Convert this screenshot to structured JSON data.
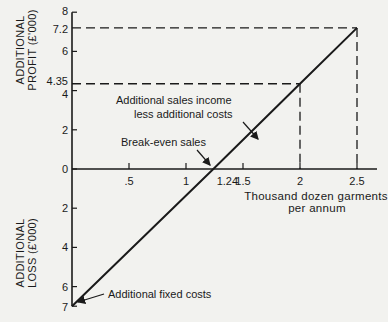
{
  "chart_data": {
    "type": "line",
    "title": "",
    "xlabel": "Thousand dozen garments per annum",
    "xlabel_lines": [
      "Thousand dozen garments",
      "per annum"
    ],
    "ylabel_profit_lines": [
      "ADDITIONAL",
      "PROFIT (£'000)"
    ],
    "ylabel_loss_lines": [
      "ADDITIONAL",
      "LOSS (£'000)"
    ],
    "xlim": [
      0,
      2.6
    ],
    "ylim": [
      -7,
      8
    ],
    "x_ticks": [
      {
        "value": 0.5,
        "label": ".5"
      },
      {
        "value": 1,
        "label": "1"
      },
      {
        "value": 1.24,
        "label": "1.24"
      },
      {
        "value": 1.5,
        "label": "1.5"
      },
      {
        "value": 2,
        "label": "2"
      },
      {
        "value": 2.5,
        "label": "2.5"
      }
    ],
    "y_ticks": [
      {
        "value": 8,
        "label": "8"
      },
      {
        "value": 7.2,
        "label": "7.2"
      },
      {
        "value": 6,
        "label": "6"
      },
      {
        "value": 4.35,
        "label": "4.35"
      },
      {
        "value": 4,
        "label": "4"
      },
      {
        "value": 2,
        "label": "2"
      },
      {
        "value": 0,
        "label": "0"
      },
      {
        "value": -2,
        "label": "2"
      },
      {
        "value": -4,
        "label": "4"
      },
      {
        "value": -6,
        "label": "6"
      },
      {
        "value": -7,
        "label": "7"
      }
    ],
    "series": [
      {
        "name": "Additional sales income less additional costs",
        "x": [
          0,
          1.24,
          2,
          2.5
        ],
        "y": [
          -7,
          0,
          4.35,
          7.2
        ]
      }
    ],
    "reference_lines": [
      {
        "type": "dashed",
        "from": [
          0,
          7.2
        ],
        "to": [
          2.5,
          7.2
        ]
      },
      {
        "type": "dashed",
        "from": [
          2.5,
          7.2
        ],
        "to": [
          2.5,
          0
        ]
      },
      {
        "type": "dashed",
        "from": [
          0,
          4.35
        ],
        "to": [
          2,
          4.35
        ]
      },
      {
        "type": "dashed",
        "from": [
          2,
          4.35
        ],
        "to": [
          2,
          0
        ]
      }
    ],
    "annotations": [
      {
        "text_lines": [
          "Additional sales income",
          "less additional costs"
        ],
        "points_to": [
          1.63,
          2.0
        ]
      },
      {
        "text": "Break-even sales",
        "points_to": [
          1.24,
          0
        ]
      },
      {
        "text": "Additional fixed costs",
        "points_to": [
          0,
          -7
        ]
      }
    ],
    "grid": false,
    "legend": "none"
  }
}
